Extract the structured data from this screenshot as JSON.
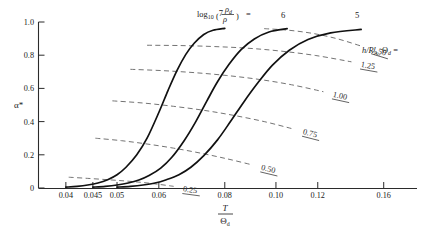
{
  "figure": {
    "background_color": "#ffffff",
    "curve_color": "#111111",
    "dashed_color": "#6b6b6b",
    "axis_color": "#2b2b2b"
  },
  "axes": {
    "y_label": "α*",
    "y_ticks": [
      "0",
      "0.2",
      "0.4",
      "0.6",
      "0.8",
      "1.0"
    ],
    "y_tick_values": [
      0,
      0.2,
      0.4,
      0.6,
      0.8,
      1.0
    ],
    "x_label_num": "T",
    "x_label_den": "Θ",
    "x_label_den_sub": "d",
    "x_ticks": [
      "0.04",
      "0.045",
      "0.05",
      "0.06",
      "0.08",
      "0.10",
      "0.12",
      "0.16"
    ],
    "x_tick_values": [
      0.04,
      0.045,
      0.05,
      0.06,
      0.08,
      0.1,
      0.12,
      0.16
    ],
    "x_scale": "log"
  },
  "annotations": {
    "family_formula_lead": "log",
    "family_formula_lead_sub": "10",
    "family_formula_num": "ρ",
    "family_formula_num_sub": "d",
    "family_formula_den": "ρ",
    "family_formula_eq": "=",
    "iso_legend_lead": "h/R",
    "iso_legend_lead_sub": "A₂",
    "iso_legend_theta": "Θ",
    "iso_legend_theta_sub": "d",
    "iso_legend_eq": "="
  },
  "chart_data": {
    "type": "line",
    "title": "",
    "xlabel": "T/Θ_d",
    "ylabel": "α*",
    "xscale": "log",
    "xlim": [
      0.0355,
      0.185
    ],
    "ylim": [
      0,
      1.0
    ],
    "grid": false,
    "legend_position": "top-right-inline",
    "series": [
      {
        "name": "7",
        "label": "7",
        "style": "solid",
        "comment": "log10(rho_d/rho) = 7",
        "x": [
          0.04,
          0.042,
          0.044,
          0.046,
          0.048,
          0.05,
          0.052,
          0.0545,
          0.057,
          0.06,
          0.0625,
          0.065,
          0.0675,
          0.07,
          0.073,
          0.076,
          0.08
        ],
        "y": [
          0.005,
          0.01,
          0.018,
          0.03,
          0.05,
          0.08,
          0.125,
          0.2,
          0.3,
          0.455,
          0.59,
          0.71,
          0.805,
          0.872,
          0.925,
          0.95,
          0.962
        ]
      },
      {
        "name": "6",
        "label": "6",
        "style": "solid",
        "comment": "log10(rho_d/rho) = 6",
        "x": [
          0.045,
          0.0475,
          0.05,
          0.0525,
          0.055,
          0.0575,
          0.0605,
          0.0635,
          0.067,
          0.0705,
          0.074,
          0.0775,
          0.0815,
          0.086,
          0.091,
          0.097,
          0.105
        ],
        "y": [
          0.005,
          0.01,
          0.018,
          0.03,
          0.048,
          0.075,
          0.12,
          0.185,
          0.285,
          0.4,
          0.525,
          0.64,
          0.745,
          0.835,
          0.898,
          0.94,
          0.96
        ]
      },
      {
        "name": "5",
        "label": "5",
        "style": "solid",
        "comment": "log10(rho_d/rho) = 5",
        "x": [
          0.05,
          0.053,
          0.056,
          0.059,
          0.062,
          0.0655,
          0.069,
          0.073,
          0.0775,
          0.082,
          0.087,
          0.0925,
          0.0985,
          0.106,
          0.115,
          0.127,
          0.145
        ],
        "y": [
          0.005,
          0.01,
          0.018,
          0.03,
          0.05,
          0.08,
          0.125,
          0.195,
          0.29,
          0.4,
          0.52,
          0.635,
          0.74,
          0.83,
          0.895,
          0.935,
          0.955
        ]
      }
    ],
    "iso_curves": [
      {
        "name": "0.25",
        "label": "0.25",
        "style": "dashed",
        "x": [
          0.0405,
          0.044,
          0.048,
          0.052,
          0.056,
          0.06,
          0.064
        ],
        "y": [
          0.065,
          0.058,
          0.05,
          0.042,
          0.033,
          0.022,
          0.01
        ]
      },
      {
        "name": "0.50",
        "label": "0.50",
        "style": "dashed",
        "x": [
          0.0455,
          0.051,
          0.057,
          0.064,
          0.072,
          0.081,
          0.09
        ],
        "y": [
          0.3,
          0.285,
          0.265,
          0.24,
          0.21,
          0.175,
          0.14
        ]
      },
      {
        "name": "0.75",
        "label": "0.75",
        "style": "dashed",
        "x": [
          0.049,
          0.056,
          0.064,
          0.073,
          0.083,
          0.095,
          0.108
        ],
        "y": [
          0.525,
          0.512,
          0.492,
          0.468,
          0.438,
          0.4,
          0.355
        ]
      },
      {
        "name": "1.00",
        "label": "1.00",
        "style": "dashed",
        "x": [
          0.053,
          0.061,
          0.07,
          0.0805,
          0.0925,
          0.107,
          0.123
        ],
        "y": [
          0.715,
          0.707,
          0.695,
          0.678,
          0.655,
          0.622,
          0.58
        ]
      },
      {
        "name": "1.25",
        "label": "1.25",
        "style": "dashed",
        "x": [
          0.057,
          0.066,
          0.0765,
          0.0885,
          0.102,
          0.119,
          0.139
        ],
        "y": [
          0.86,
          0.858,
          0.852,
          0.842,
          0.825,
          0.798,
          0.76
        ]
      },
      {
        "name": "1.50",
        "label": "1.50",
        "style": "dashed",
        "x": [
          0.095,
          0.106,
          0.118,
          0.131,
          0.146
        ],
        "y": [
          0.96,
          0.95,
          0.93,
          0.898,
          0.852
        ]
      }
    ]
  },
  "caption": {
    "text": ""
  }
}
